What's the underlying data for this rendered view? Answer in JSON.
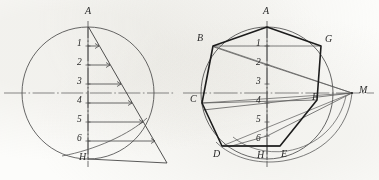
{
  "figure": {
    "type": "geometric-construction-drawing",
    "medium": "pencil line drawing on paper",
    "panels": [
      {
        "id": "left",
        "name": "Division of the diameter AH into seven equal parts",
        "circle": {
          "cx": 88,
          "cy": 93,
          "r": 66,
          "style": "thin-solid"
        },
        "axis_horizontal": {
          "x1": 4,
          "y1": 93,
          "x2": 175,
          "y2": 93,
          "style": "dash-dot-centreline"
        },
        "axis_vertical": {
          "x1": 88,
          "y1": 22,
          "x2": 88,
          "y2": 166,
          "style": "dash-dot-centreline"
        },
        "diameter_endpoints": {
          "top": "A",
          "bottom": "H"
        },
        "division_points": [
          "1",
          "2",
          "3",
          "4",
          "5",
          "6"
        ],
        "division_count": 7,
        "auxiliary_ray": {
          "from": "A",
          "to_x": 167,
          "to_y": 163,
          "style": "thin-solid"
        },
        "parallel_lines": 7,
        "point_labels": [
          {
            "text": "A",
            "x": 85,
            "y": 8
          },
          {
            "text": "1",
            "x": 78,
            "y": 34
          },
          {
            "text": "2",
            "x": 78,
            "y": 54
          },
          {
            "text": "3",
            "x": 78,
            "y": 74
          },
          {
            "text": "4",
            "x": 78,
            "y": 94
          },
          {
            "text": "5",
            "x": 78,
            "y": 114
          },
          {
            "text": "6",
            "x": 78,
            "y": 134
          },
          {
            "text": "H",
            "x": 80,
            "y": 154
          }
        ]
      },
      {
        "id": "right",
        "name": "Regular heptagon ABCDEFG inscribed in the circle with pole M",
        "circle": {
          "cx": 267,
          "cy": 93,
          "r": 66,
          "style": "thin-solid"
        },
        "axis_horizontal": {
          "x1": 183,
          "y1": 93,
          "x2": 372,
          "y2": 93,
          "style": "dash-dot-centreline"
        },
        "axis_vertical": {
          "x1": 267,
          "y1": 22,
          "x2": 267,
          "y2": 166,
          "style": "dash-dot-centreline"
        },
        "diameter_endpoints": {
          "top": "A",
          "bottom": "H"
        },
        "division_points": [
          "1",
          "2",
          "3",
          "4",
          "5",
          "6"
        ],
        "polygon": {
          "sides": 7,
          "name": "heptagon",
          "vertices": [
            "A",
            "B",
            "C",
            "D",
            "E",
            "F",
            "G"
          ],
          "style": "thick-solid"
        },
        "pole": {
          "label": "M",
          "x": 352,
          "y": 93
        },
        "construction_rays_from_pole": [
          "M-2",
          "M-4",
          "M-6"
        ],
        "arcs_from_pole": 2,
        "point_labels": [
          {
            "text": "A",
            "x": 263,
            "y": 8
          },
          {
            "text": "B",
            "x": 196,
            "y": 35
          },
          {
            "text": "G",
            "x": 314,
            "y": 36
          },
          {
            "text": "C",
            "x": 182,
            "y": 95
          },
          {
            "text": "F",
            "x": 310,
            "y": 92
          },
          {
            "text": "D",
            "x": 213,
            "y": 152
          },
          {
            "text": "E",
            "x": 268,
            "y": 152
          },
          {
            "text": "H",
            "x": 252,
            "y": 152
          },
          {
            "text": "M",
            "x": 359,
            "y": 86
          },
          {
            "text": "1",
            "x": 256,
            "y": 34
          },
          {
            "text": "2",
            "x": 256,
            "y": 54
          },
          {
            "text": "3",
            "x": 256,
            "y": 74
          },
          {
            "text": "4",
            "x": 256,
            "y": 94
          },
          {
            "text": "5",
            "x": 256,
            "y": 114
          },
          {
            "text": "6",
            "x": 256,
            "y": 134
          }
        ]
      }
    ],
    "colors": {
      "paper": "#fcfcfa",
      "thin_line": "#4a4a4a",
      "thick_line": "#1d1d1d",
      "centre_line": "#5a5a5a",
      "label_text": "#2b2b2b"
    }
  }
}
